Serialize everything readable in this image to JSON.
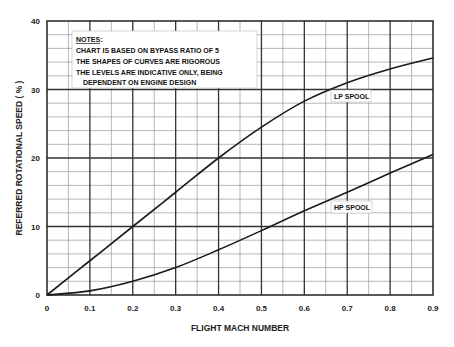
{
  "chart_data": {
    "type": "line",
    "title": "",
    "xlabel": "FLIGHT MACH NUMBER",
    "ylabel": "REFERRED ROTATIONAL SPEED ( % )",
    "xlim": [
      0,
      0.9
    ],
    "ylim": [
      0,
      40
    ],
    "x_ticks": [
      "0",
      "0.1",
      "0.2",
      "0.3",
      "0.4",
      "0.5",
      "0.6",
      "0.7",
      "0.8",
      "0.9"
    ],
    "y_ticks": [
      "0",
      "10",
      "20",
      "30",
      "40"
    ],
    "grid": true,
    "x": [
      0,
      0.1,
      0.2,
      0.3,
      0.4,
      0.5,
      0.6,
      0.7,
      0.8,
      0.9
    ],
    "series": [
      {
        "name": "LP SPOOL",
        "values": [
          0,
          5,
          10,
          15,
          20,
          24.5,
          28.3,
          31,
          33,
          34.6
        ]
      },
      {
        "name": "HP SPOOL",
        "values": [
          0,
          0.6,
          2,
          4,
          6.6,
          9.4,
          12.3,
          15,
          17.8,
          20.5
        ]
      }
    ],
    "annotations": {
      "notes_heading": "NOTES",
      "notes_suffix": ":",
      "notes_lines": [
        "CHART IS BASED ON BYPASS RATIO OF 5",
        "THE SHAPES OF CURVES ARE RIGOROUS",
        "THE LEVELS ARE INDICATIVE ONLY, BEING",
        "DEPENDENT ON ENGINE DESIGN"
      ],
      "lp_label": "LP SPOOL",
      "hp_label": "HP SPOOL"
    }
  }
}
